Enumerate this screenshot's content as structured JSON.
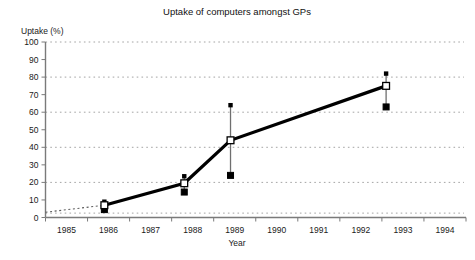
{
  "chart_data": {
    "type": "line",
    "title": "Uptake of computers amongst GPs",
    "xlabel": "Year",
    "ylabel": "Uptake (%)",
    "xlim": [
      1984.5,
      1994.5
    ],
    "ylim": [
      0,
      100
    ],
    "ytick_step": 10,
    "yticks": [
      0,
      10,
      20,
      30,
      40,
      50,
      60,
      70,
      80,
      90,
      100
    ],
    "ytick_labels": [
      "0",
      "10",
      "20",
      "30",
      "40",
      "50",
      "60",
      "70",
      "80",
      "90",
      "100"
    ],
    "gridlines_at": [
      20,
      40,
      60,
      80,
      100
    ],
    "grid": true,
    "legend": "none",
    "xticks": [
      1985,
      1986,
      1987,
      1988,
      1989,
      1990,
      1991,
      1992,
      1993,
      1994
    ],
    "xtick_labels": [
      "1985",
      "1986",
      "1987",
      "1988",
      "1989",
      "1990",
      "1991",
      "1992",
      "1993",
      "1994"
    ],
    "series": [
      {
        "name": "Uptake of computers amongst GPs",
        "marker": "open-square",
        "x": [
          1985.9,
          1987.8,
          1988.9,
          1992.6
        ],
        "values": [
          7,
          19.5,
          44,
          75
        ],
        "error_high": [
          9,
          23.5,
          64,
          82
        ],
        "error_low": [
          4.5,
          14.5,
          24,
          63
        ]
      }
    ],
    "lead_in": {
      "description": "dotted segment from y-axis to first data point",
      "x": [
        1984.5,
        1985.9
      ],
      "values": [
        3,
        7
      ]
    },
    "colors": {
      "line": "#000000",
      "grid": "#8d8d8d",
      "axis": "#7a7a7a",
      "marker_face": "#ffffff",
      "marker_edge": "#000000",
      "errorbar": "#6f6f6f",
      "background": "#ffffff"
    }
  }
}
